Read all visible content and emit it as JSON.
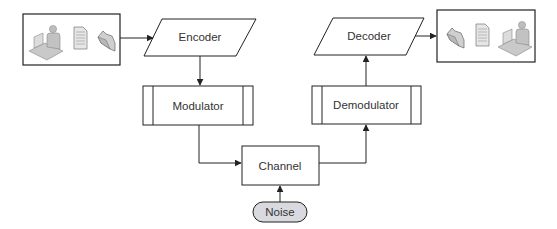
{
  "diagram": {
    "nodes": {
      "source": {
        "icons": [
          "user-at-computer-icon",
          "document-icon",
          "folder-icon"
        ]
      },
      "encoder": {
        "label": "Encoder",
        "shape": "parallelogram"
      },
      "modulator": {
        "label": "Modulator",
        "shape": "predefined-process"
      },
      "channel": {
        "label": "Channel",
        "shape": "rectangle"
      },
      "noise": {
        "label": "Noise",
        "shape": "terminator",
        "fill": "#d9dadf"
      },
      "demodulator": {
        "label": "Demodulator",
        "shape": "predefined-process"
      },
      "decoder": {
        "label": "Decoder",
        "shape": "parallelogram"
      },
      "destination": {
        "icons": [
          "folder-icon",
          "document-icon",
          "user-at-computer-icon"
        ]
      }
    },
    "edges": [
      {
        "from": "source",
        "to": "encoder"
      },
      {
        "from": "encoder",
        "to": "modulator"
      },
      {
        "from": "modulator",
        "to": "channel"
      },
      {
        "from": "noise",
        "to": "channel"
      },
      {
        "from": "channel",
        "to": "demodulator"
      },
      {
        "from": "demodulator",
        "to": "decoder"
      },
      {
        "from": "decoder",
        "to": "destination"
      }
    ],
    "colors": {
      "stroke": "#222222",
      "text": "#333333",
      "icon_fill": "#c8c8c8",
      "noise_fill": "#d9dadf"
    }
  }
}
